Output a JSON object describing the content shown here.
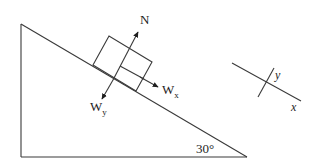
{
  "diagram": {
    "type": "free-body-diagram",
    "incline": {
      "angle_label": "30°",
      "angle_degrees": 30
    },
    "forces": [
      {
        "id": "normal",
        "label": "N",
        "subscript": ""
      },
      {
        "id": "weight-x",
        "label": "W",
        "subscript": "x"
      },
      {
        "id": "weight-y",
        "label": "W",
        "subscript": "y"
      }
    ],
    "axes": {
      "x_label": "x",
      "y_label": "y"
    },
    "colors": {
      "line": "#3a3a3a",
      "text": "#1e1e1e",
      "background": "#ffffff"
    }
  }
}
